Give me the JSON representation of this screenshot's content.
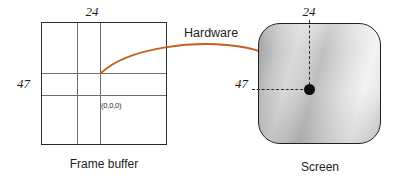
{
  "diagram": {
    "title_text": "Frame buffer to screen mapping",
    "accent_color": "#C4601E",
    "frame_buffer": {
      "caption": "Frame buffer",
      "top_label": "24",
      "left_label": "47",
      "origin_cell_label": "(0,0,0)"
    },
    "screen": {
      "caption": "Screen",
      "top_label": "24",
      "left_label": "47"
    },
    "arrow": {
      "label": "Hardware"
    }
  }
}
